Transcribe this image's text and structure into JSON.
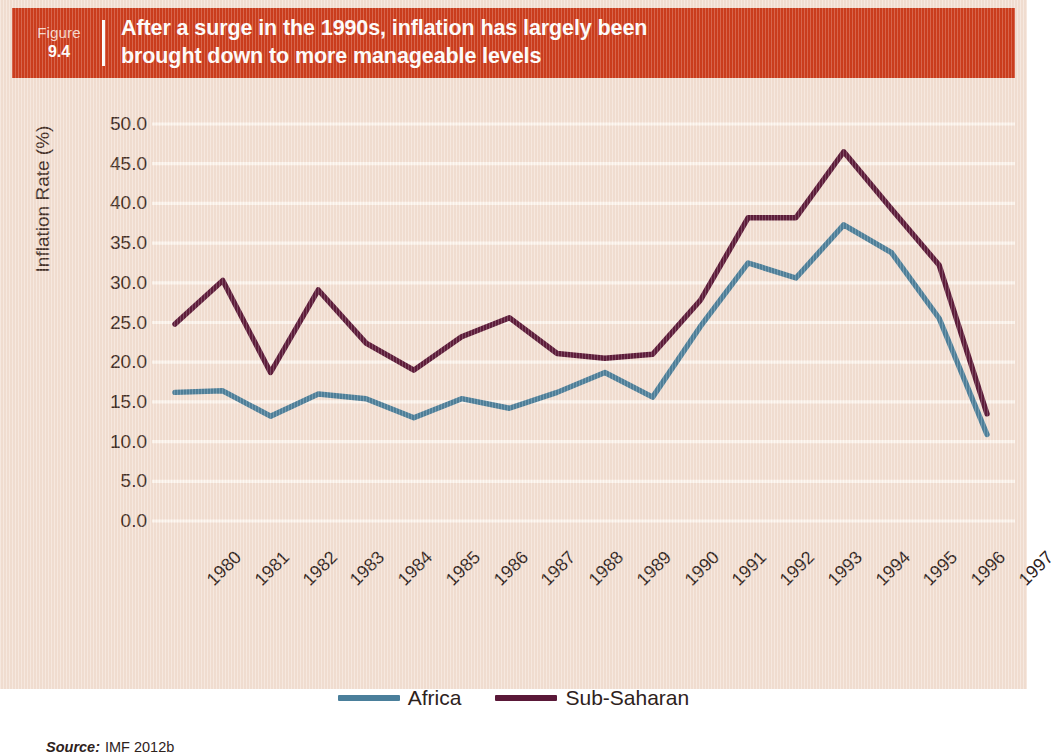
{
  "figure": {
    "label": "Figure",
    "number": "9.4",
    "title_line1": "After a surge in the 1990s, inflation has largely been",
    "title_line2": "brought down to more manageable levels"
  },
  "source": {
    "word": "Source:",
    "value": "IMF 2012b"
  },
  "colors": {
    "banner_red": "#cc3a1a",
    "background": "#f4e2d6",
    "gridline": "#fdf6ef",
    "africa": "#4a7f9b",
    "sub_saharan": "#5a1838",
    "text": "#2e221c"
  },
  "chart_data": {
    "type": "line",
    "title": "After a surge in the 1990s, inflation has largely been brought down to more manageable levels",
    "xlabel": "",
    "ylabel": "Inflation Rate (%)",
    "ylim": [
      0,
      50
    ],
    "ytick_step": 5,
    "ytick_labels": [
      "50.0",
      "45.0",
      "40.0",
      "35.0",
      "30.0",
      "25.0",
      "20.0",
      "15.0",
      "10.0",
      "5.0",
      "0.0"
    ],
    "ytick_values": [
      50,
      45,
      40,
      35,
      30,
      25,
      20,
      15,
      10,
      5,
      0
    ],
    "grid": true,
    "grid_axis": "y",
    "legend_position": "bottom-center",
    "categories": [
      "1980",
      "1981",
      "1982",
      "1983",
      "1984",
      "1985",
      "1986",
      "1987",
      "1988",
      "1989",
      "1990",
      "1991",
      "1992",
      "1993",
      "1994",
      "1995",
      "1996",
      "1997"
    ],
    "series": [
      {
        "name": "Africa",
        "color": "#4a7f9b",
        "values": [
          16.2,
          16.4,
          13.2,
          16.0,
          15.4,
          13.0,
          15.4,
          14.2,
          16.2,
          18.7,
          15.6,
          24.5,
          32.5,
          30.6,
          37.3,
          33.8,
          25.5,
          10.9
        ]
      },
      {
        "name": "Sub-Saharan",
        "color": "#5a1838",
        "values": [
          24.8,
          30.3,
          18.7,
          29.1,
          22.4,
          19.0,
          23.2,
          25.6,
          21.1,
          20.5,
          21.0,
          27.8,
          38.2,
          38.2,
          46.5,
          39.3,
          32.2,
          13.5
        ]
      }
    ]
  }
}
